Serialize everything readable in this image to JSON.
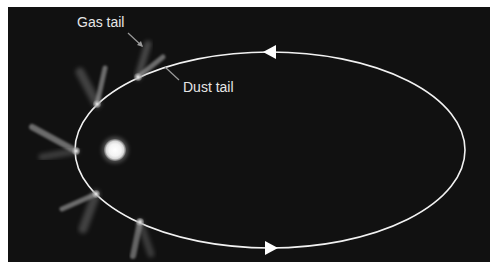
{
  "diagram": {
    "colors": {
      "background": "#111111",
      "border": "#ffffff",
      "orbit": "#f2f2f2",
      "sun_core": "#ffffff",
      "sun_glow": "#cfcfcf",
      "comet_head": "#d0d0d0",
      "tail": "#9a9a9a",
      "label": "#e6e6e6"
    },
    "orbit": {
      "cx": 270,
      "cy": 150,
      "rx": 195,
      "ry": 98,
      "direction": "counter-clockwise"
    },
    "sun": {
      "cx": 115,
      "cy": 150,
      "r": 11
    },
    "arrows": [
      {
        "name": "top-arrow",
        "x": 270,
        "y": 52,
        "points_to": "left"
      },
      {
        "name": "bottom-arrow",
        "x": 271,
        "y": 248,
        "points_to": "right"
      }
    ],
    "comets": [
      {
        "x": 138,
        "y": 77,
        "dust_tail": [
          163,
          57
        ],
        "gas_tail": [
          148,
          44
        ]
      },
      {
        "x": 97,
        "y": 104,
        "dust_tail": [
          105,
          68
        ],
        "gas_tail": [
          80,
          72
        ]
      },
      {
        "x": 76,
        "y": 151,
        "dust_tail": [
          32,
          127
        ],
        "gas_tail": [
          42,
          157
        ]
      },
      {
        "x": 96,
        "y": 194,
        "dust_tail": [
          62,
          209
        ],
        "gas_tail": [
          83,
          229
        ]
      },
      {
        "x": 140,
        "y": 222,
        "dust_tail": [
          133,
          256
        ],
        "gas_tail": [
          151,
          254
        ]
      }
    ],
    "labels": {
      "gas_tail": {
        "text": "Gas tail",
        "x": 77,
        "y": 27
      },
      "dust_tail": {
        "text": "Dust tail",
        "x": 183,
        "y": 92
      }
    },
    "pointers": {
      "gas_tail": {
        "x1": 128,
        "y1": 33,
        "x2": 142,
        "y2": 46
      },
      "dust_tail": {
        "x1": 165,
        "y1": 67,
        "x2": 179,
        "y2": 80
      }
    }
  }
}
